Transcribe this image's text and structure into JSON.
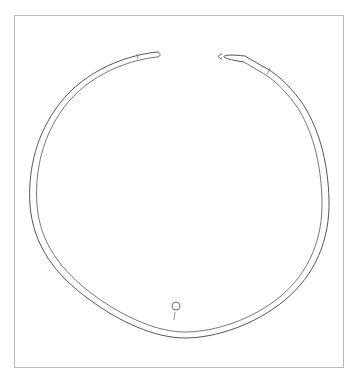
{
  "figure": {
    "frame_color": "#b8b8b8",
    "line_color": "#555555",
    "marker": {
      "shape": "circle",
      "label": ""
    }
  }
}
